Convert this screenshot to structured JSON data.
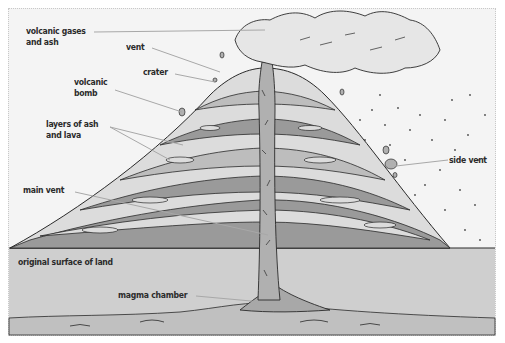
{
  "diagram": {
    "labels": {
      "volcanic_gases_line1": "volcanic gases",
      "volcanic_gases_line2": "and ash",
      "vent": "vent",
      "crater": "crater",
      "volcanic_bomb_line1": "volcanic",
      "volcanic_bomb_line2": "bomb",
      "layers_line1": "layers of ash",
      "layers_line2": "and lava",
      "main_vent": "main vent",
      "original_surface": "original surface of land",
      "magma_chamber": "magma chamber",
      "side_vent": "side vent"
    },
    "colors": {
      "background": "#f4f4f4",
      "ground": "#cfcfcf",
      "layer_dark": "#9a9a9a",
      "layer_mid": "#bdbdbd",
      "layer_light": "#dcdcdc",
      "outline": "#2a2a2a",
      "leader_line": "#a8a8a8"
    }
  }
}
